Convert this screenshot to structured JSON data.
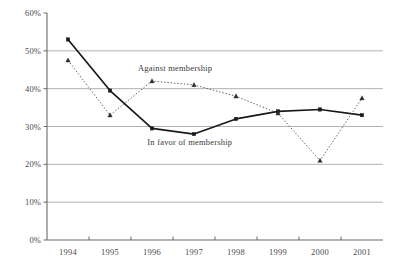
{
  "chart_data": {
    "type": "line",
    "title": "",
    "xlabel": "",
    "ylabel": "",
    "categories": [
      "1994",
      "1995",
      "1996",
      "1997",
      "1998",
      "1999",
      "2000",
      "2001"
    ],
    "ylim": [
      0,
      60
    ],
    "yticks": [
      "0%",
      "10%",
      "20%",
      "30%",
      "40%",
      "50%",
      "60%"
    ],
    "ytick_values": [
      0,
      10,
      20,
      30,
      40,
      50,
      60
    ],
    "grid": "horizontal",
    "legend_position": "inline-annotation",
    "series": [
      {
        "name": "In favor of membership",
        "style": "solid",
        "marker": "square",
        "color": "#1a1a1a",
        "values": [
          53,
          39.5,
          29.5,
          28,
          32,
          34,
          34.5,
          33
        ]
      },
      {
        "name": "Against membership",
        "style": "dotted",
        "marker": "triangle",
        "color": "#4d4d4d",
        "values": [
          47.5,
          33,
          42,
          41,
          38,
          33.5,
          21,
          37.5
        ]
      }
    ],
    "annotations": [
      {
        "text": "Against membership",
        "x": 1996.55,
        "y": 44.6
      },
      {
        "text": "In favor of membership",
        "x": 1996.9,
        "y": 25.2
      }
    ]
  }
}
